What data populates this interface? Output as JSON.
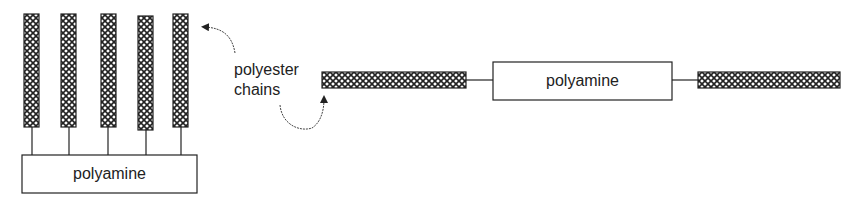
{
  "diagram": {
    "left_structure": {
      "backbone_label": "polyamine",
      "chain_count": 5
    },
    "annotation": {
      "line1": "polyester",
      "line2": "chains"
    },
    "right_structure": {
      "backbone_label": "polyamine",
      "chain_count": 2
    }
  }
}
